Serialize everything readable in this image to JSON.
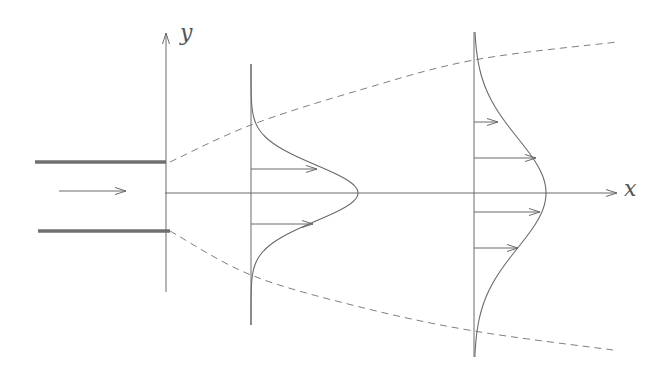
{
  "diagram": {
    "title": "",
    "colors": {
      "line": "#6a6a6a",
      "wall": "#707070",
      "dash": "#808080",
      "text": "#555555",
      "background": "#ffffff"
    },
    "axes": {
      "x_label": "x",
      "y_label": "y"
    },
    "nozzle": {
      "description": "channel walls with inflow arrow",
      "top_wall": [
        [
          35,
          162
        ],
        [
          166,
          162
        ]
      ],
      "bottom_wall": [
        [
          38,
          231
        ],
        [
          170,
          231
        ]
      ],
      "inflow_arrow": [
        [
          59,
          191
        ],
        [
          126,
          191
        ]
      ]
    },
    "spreading_boundary": {
      "style": "dashed",
      "upper": [
        [
          170,
          162
        ],
        [
          251,
          125
        ],
        [
          360,
          90
        ],
        [
          474,
          60
        ],
        [
          617,
          42
        ]
      ],
      "lower": [
        [
          170,
          231
        ],
        [
          251,
          275
        ],
        [
          360,
          307
        ],
        [
          474,
          331
        ],
        [
          613,
          350
        ]
      ]
    },
    "profiles": [
      {
        "name": "profile-near",
        "station_x": 251,
        "top_y": 64,
        "bottom_y": 325,
        "peak_x": 358,
        "half_width": 28,
        "arrows": [
          {
            "y": 169,
            "tip_x": 317
          },
          {
            "y": 224,
            "tip_x": 313
          }
        ]
      },
      {
        "name": "profile-far",
        "station_x": 474,
        "top_y": 32,
        "bottom_y": 357,
        "peak_x": 546,
        "half_width": 55,
        "arrows": [
          {
            "y": 122,
            "tip_x": 498
          },
          {
            "y": 158,
            "tip_x": 536
          },
          {
            "y": 212,
            "tip_x": 540
          },
          {
            "y": 248,
            "tip_x": 518
          }
        ]
      }
    ]
  }
}
